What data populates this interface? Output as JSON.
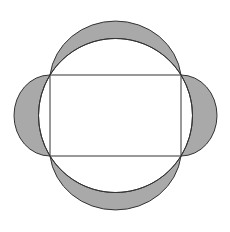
{
  "diagram": {
    "type": "geometry",
    "colors": {
      "background": "#ffffff",
      "stroke": "#333333",
      "lune_fill": "#a9a9a9"
    },
    "rectangle": {
      "x": 50,
      "y": 75,
      "width": 131,
      "height": 81
    },
    "circumcircle": {
      "cx": 115.5,
      "cy": 115.5,
      "r": 77
    },
    "lunes": [
      {
        "side": "top"
      },
      {
        "side": "bottom"
      },
      {
        "side": "left"
      },
      {
        "side": "right"
      }
    ]
  }
}
